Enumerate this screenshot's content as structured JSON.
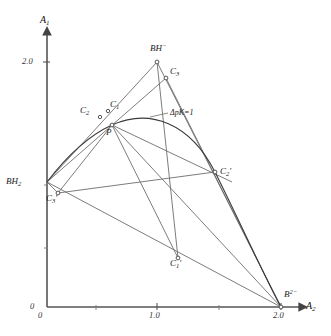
{
  "figure": {
    "background": "#ffffff",
    "line_color": "#6d6d6d",
    "curve_color": "#3a3a3a",
    "axis_color": "#555555"
  },
  "axes": {
    "x": {
      "label": "A",
      "label_sub": "2",
      "ticks": [
        {
          "value": "0",
          "px": 47
        },
        {
          "value": "1.0",
          "px": 157
        },
        {
          "value": "2.0",
          "px": 281
        }
      ],
      "range": [
        0,
        2.0
      ]
    },
    "y": {
      "label": "A",
      "label_sub": "1",
      "ticks": [
        {
          "value": "0",
          "px": 307
        },
        {
          "value": "2.0",
          "px": 62
        }
      ],
      "range": [
        0,
        2.0
      ]
    }
  },
  "annotations": [
    {
      "name": "delta-pk-annotation",
      "text": "ΔpK=1",
      "x": 152,
      "y": 114
    }
  ],
  "points": [
    {
      "name": "bh2",
      "label": "BH",
      "sub": "2",
      "sup": "",
      "px": 47,
      "py": 182,
      "lx": 6,
      "ly": 176,
      "marker": false
    },
    {
      "name": "bh-minus",
      "label": "BH",
      "sub": "",
      "sup": "−",
      "px": 157,
      "py": 62,
      "lx": 150,
      "ly": 45,
      "marker": true
    },
    {
      "name": "b2-minus",
      "label": "B",
      "sub": "",
      "sup": "2−",
      "px": 281,
      "py": 307,
      "lx": 284,
      "ly": 292,
      "marker": true
    },
    {
      "name": "c1",
      "label": "C",
      "sub": "1",
      "sup": "",
      "px": 108,
      "py": 111,
      "lx": 110,
      "ly": 101,
      "marker": true
    },
    {
      "name": "c2",
      "label": "C",
      "sub": "2",
      "sup": "",
      "px": 100,
      "py": 117,
      "lx": 82,
      "ly": 106,
      "marker": true
    },
    {
      "name": "c3",
      "label": "C",
      "sub": "3",
      "sup": "",
      "px": 166,
      "py": 78,
      "lx": 170,
      "ly": 69,
      "marker": true
    },
    {
      "name": "p",
      "label": "P",
      "sub": "",
      "sup": "",
      "px": 112,
      "py": 125,
      "lx": 108,
      "ly": 128,
      "marker": true
    },
    {
      "name": "c1-prime",
      "label": "C",
      "sub": "1",
      "sup": "",
      "prime": true,
      "px": 178,
      "py": 258,
      "lx": 172,
      "ly": 259,
      "marker": true
    },
    {
      "name": "c2-prime",
      "label": "C",
      "sub": "2",
      "sup": "",
      "prime": true,
      "px": 215,
      "py": 172,
      "lx": 220,
      "ly": 168,
      "marker": true
    },
    {
      "name": "c3-prime",
      "label": "C",
      "sub": "3",
      "sup": "",
      "prime": true,
      "px": 58,
      "py": 193,
      "lx": 48,
      "ly": 194,
      "marker": true
    }
  ]
}
